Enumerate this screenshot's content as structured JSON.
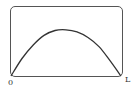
{
  "chart_data": {
    "type": "line",
    "title": "",
    "xlabel": "",
    "ylabel": "",
    "x_tick_labels": [
      "0",
      "L"
    ],
    "y_tick_labels": [
      ""
    ],
    "y_values_normalized": true,
    "y_values_note": "y values are fractions of plot height; top y-axis label is clipped and unreadable",
    "grid": false,
    "legend": null,
    "series": [
      {
        "name": "curve",
        "x": [
          0,
          0.1,
          0.2,
          0.3,
          0.4,
          0.5,
          0.6,
          0.7,
          0.8,
          0.9,
          1.0
        ],
        "y": [
          0,
          0.25,
          0.44,
          0.58,
          0.65,
          0.66,
          0.63,
          0.55,
          0.42,
          0.22,
          0
        ]
      }
    ]
  },
  "labels": {
    "y_top": "",
    "x_start": "0",
    "x_end": "L"
  },
  "colors": {
    "curve": "#333333",
    "frame": "#555555"
  }
}
